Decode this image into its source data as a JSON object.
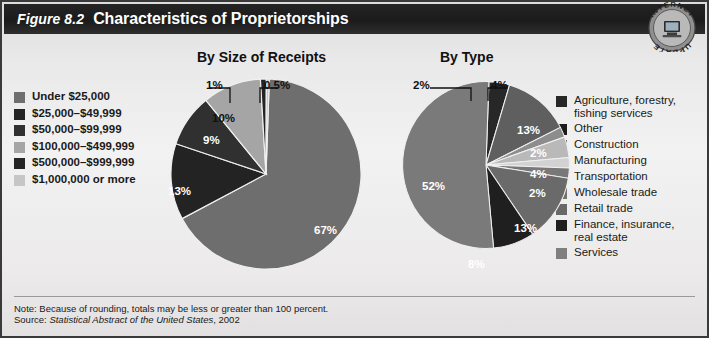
{
  "header": {
    "figure_number": "Figure 8.2",
    "title": "Characteristics of Proprietorships",
    "badge": {
      "top_text": "INTERNET",
      "bottom_text": "UPDATE",
      "icon": "computer-icon"
    }
  },
  "footer": {
    "note": "Note: Because of rounding, totals may be less or greater than 100 percent.",
    "source_prefix": "Source: ",
    "source_italic": "Statistical Abstract of the United States",
    "source_suffix": ", 2002"
  },
  "colors": {
    "header_bg": "#1b1b1b",
    "page_bg": "#ececec",
    "text": "#1a1a1a",
    "rule": "#9a9a9a",
    "g_dark1": "#1e1e1e",
    "g_dark2": "#2b2b2b",
    "g_dark3": "#3a3a3a",
    "g_mid1": "#5e5e5e",
    "g_mid2": "#6e6e6e",
    "g_mid3": "#7c7c7c",
    "g_light1": "#9e9e9e",
    "g_light2": "#b5b5b5",
    "g_light3": "#cfcfcf"
  },
  "chart_data": [
    {
      "type": "pie",
      "title": "By Size of Receipts",
      "legend_position": "left",
      "categories": [
        "Under $25,000",
        "$25,000–$49,999",
        "$50,000–$99,999",
        "$100,000–$499,999",
        "$500,000–$999,999",
        "$1,000,000 or more"
      ],
      "values": [
        67,
        13,
        9,
        10,
        1,
        0.5
      ],
      "labels": [
        "67%",
        "13%",
        "9%",
        "10%",
        "1%",
        "0.5%"
      ],
      "slice_colors": [
        "#6e6e6e",
        "#232323",
        "#303030",
        "#a5a5a5",
        "#242424",
        "#c6c6c6"
      ],
      "xlabel": "",
      "ylabel": ""
    },
    {
      "type": "pie",
      "title": "By Type",
      "legend_position": "right",
      "categories": [
        "Agriculture, forestry,\nfishing services",
        "Other",
        "Construction",
        "Manufacturing",
        "Transportation",
        "Wholesale trade",
        "Retail trade",
        "Finance, insurance,\nreal estate",
        "Services"
      ],
      "values": [
        4,
        13,
        2,
        4,
        2,
        2,
        13,
        8,
        52
      ],
      "labels": [
        "4%",
        "13%",
        "2%",
        "4%",
        "2%",
        "2%",
        "13%",
        "8%",
        "52%"
      ],
      "slice_colors": [
        "#272727",
        "#5f5f5f",
        "#8d8d8d",
        "#b9b9b9",
        "#d2d2d2",
        "#787878",
        "#6a6a6a",
        "#1f1f1f",
        "#7a7a7a"
      ],
      "xlabel": "",
      "ylabel": ""
    }
  ],
  "pie_left_labels": {
    "p67": "67%",
    "p13": "13%",
    "p9": "9%",
    "p10": "10%",
    "p1": "1%",
    "p05": "0.5%"
  },
  "pie_right_labels": {
    "p2a": "2%",
    "p4a": "4%",
    "p13a": "13%",
    "p2b": "2%",
    "p4b": "4%",
    "p2c": "2%",
    "p13b": "13%",
    "p8": "8%",
    "p52": "52%"
  }
}
